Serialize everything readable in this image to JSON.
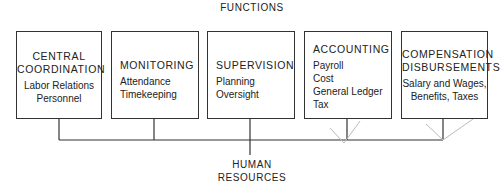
{
  "diagram": {
    "title": "FUNCTIONS",
    "root": {
      "line1": "HUMAN",
      "line2": "RESOURCES"
    },
    "boxes": [
      {
        "heading": [
          "CENTRAL",
          "COORDINATION"
        ],
        "items": [
          "Labor Relations",
          "Personnel"
        ]
      },
      {
        "heading": [
          "MONITORING"
        ],
        "items": [
          "Attendance",
          "Timekeeping"
        ]
      },
      {
        "heading": [
          "SUPERVISION"
        ],
        "items": [
          "Planning",
          "Oversight"
        ]
      },
      {
        "heading": [
          "ACCOUNTING"
        ],
        "items": [
          "Payroll",
          "Cost",
          "General Ledger",
          "Tax"
        ]
      },
      {
        "heading": [
          "COMPENSATION",
          "DISBURSEMENTS"
        ],
        "items": [
          "Salary and Wages,",
          "Benefits, Taxes"
        ]
      }
    ],
    "colors": {
      "line": "#333333",
      "faint_line": "#bbbbbb",
      "text": "#222222",
      "background": "#ffffff"
    }
  }
}
